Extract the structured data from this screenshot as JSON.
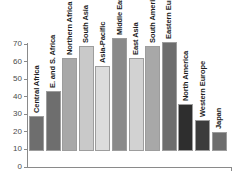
{
  "chart_data": {
    "type": "bar",
    "title": "",
    "subtitle": "",
    "xlabel": "",
    "ylabel": "",
    "ylim": [
      0,
      70
    ],
    "grid": false,
    "legend": "none",
    "categories": [
      "Central Africa",
      "E. and S. Africa",
      "Northern Africa",
      "South Asia",
      "Asia-Pacific",
      "Middle East",
      "East Asia",
      "South America",
      "Eastern Europe",
      "North America",
      "Western Europe",
      "Japan"
    ],
    "values": [
      20,
      34,
      53,
      60,
      48.5,
      64.5,
      53,
      60,
      62,
      27,
      17.5,
      11
    ],
    "bar_colors": [
      "#6e6e6e",
      "#6e6e6e",
      "#a8a8a8",
      "#c9c9c9",
      "#dcdcdc",
      "#8a8a8a",
      "#d2d2d2",
      "#a8a8a8",
      "#6e6e6e",
      "#2e2e2e",
      "#3c3c3c",
      "#6e6e6e"
    ],
    "yticks": [
      {
        "value": 70,
        "label": "70"
      },
      {
        "value": 60,
        "label": "60"
      },
      {
        "value": 50,
        "label": "50"
      },
      {
        "value": 40,
        "label": "40"
      },
      {
        "value": 30,
        "label": "30"
      },
      {
        "value": 20,
        "label": "20"
      },
      {
        "value": 10,
        "label": "10"
      },
      {
        "value": 0,
        "label": "0"
      }
    ]
  },
  "colors": {
    "axis": "#8a8a8a",
    "tick_text": "#4a4a4a",
    "bar_outline": "#9d9d9d",
    "label_text": "#1c1c1c",
    "background": "#ffffff"
  }
}
